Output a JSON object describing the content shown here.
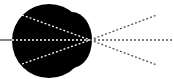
{
  "diagram": {
    "type": "ray-diagram",
    "colors": {
      "background": "#ffffff",
      "body_fill": "#000000",
      "ray_on_body": "#ffffff",
      "ray_off_body": "#555555",
      "axis_line": "#333333"
    },
    "body": {
      "main_circle": {
        "cx": 49,
        "cy": 41,
        "r": 37
      },
      "bulge": {
        "cx": 72,
        "cy": 40,
        "rx": 20,
        "ry": 28
      }
    },
    "focal_point": {
      "x": 90,
      "y": 40
    },
    "axis_segment": {
      "x1": 0,
      "y1": 40,
      "x2": 12,
      "y2": 40
    },
    "rays": [
      {
        "name": "upper-left",
        "x1": 22,
        "y1": 15,
        "x2": 90,
        "y2": 40,
        "on_body": true
      },
      {
        "name": "center-left",
        "x1": 12,
        "y1": 40,
        "x2": 90,
        "y2": 40,
        "on_body": true
      },
      {
        "name": "lower-left",
        "x1": 22,
        "y1": 64,
        "x2": 90,
        "y2": 40,
        "on_body": true
      },
      {
        "name": "upper-right",
        "x1": 90,
        "y1": 40,
        "x2": 157,
        "y2": 15,
        "on_body": false
      },
      {
        "name": "center-right",
        "x1": 90,
        "y1": 40,
        "x2": 174,
        "y2": 40,
        "on_body": false
      },
      {
        "name": "lower-right",
        "x1": 90,
        "y1": 40,
        "x2": 157,
        "y2": 65,
        "on_body": false
      }
    ]
  }
}
